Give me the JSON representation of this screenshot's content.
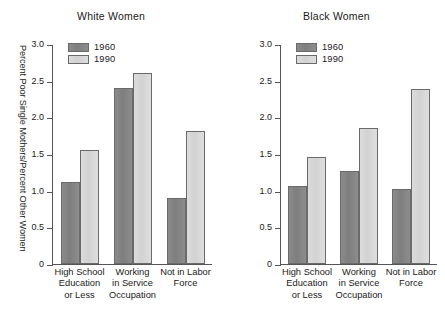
{
  "chart_data": [
    {
      "type": "bar",
      "title": "White Women",
      "xlabel": "",
      "ylabel": "Percent Poor Single Mothers/Percent Other Women",
      "ylim": [
        0,
        3.0
      ],
      "yticks": [
        "0",
        "0.5",
        "1.0",
        "1.5",
        "2.0",
        "2.5",
        "3.0"
      ],
      "ytick_values": [
        0,
        0.5,
        1.0,
        1.5,
        2.0,
        2.5,
        3.0
      ],
      "grid": false,
      "legend_position": "upper-left-inside",
      "categories": [
        [
          "High School",
          "Education",
          "or Less"
        ],
        [
          "Working",
          "in Service",
          "Occupation"
        ],
        [
          "Not in Labor",
          "Force"
        ]
      ],
      "series": [
        {
          "name": "1960",
          "color": "#828282",
          "values": [
            1.12,
            2.4,
            0.9
          ]
        },
        {
          "name": "1990",
          "color": "#d7d7d7",
          "values": [
            1.56,
            2.61,
            1.81
          ]
        }
      ]
    },
    {
      "type": "bar",
      "title": "Black Women",
      "xlabel": "",
      "ylabel": "Percent Poor Single Mothers/Percent Other Women",
      "ylim": [
        0,
        3.0
      ],
      "yticks": [
        "0",
        "0.5",
        "1.0",
        "1.5",
        "2.0",
        "2.5",
        "3.0"
      ],
      "ytick_values": [
        0,
        0.5,
        1.0,
        1.5,
        2.0,
        2.5,
        3.0
      ],
      "grid": false,
      "legend_position": "upper-left-inside",
      "categories": [
        [
          "High School",
          "Education",
          "or Less"
        ],
        [
          "Working",
          "in Service",
          "Occupation"
        ],
        [
          "Not in Labor",
          "Force"
        ]
      ],
      "series": [
        {
          "name": "1960",
          "color": "#828282",
          "values": [
            1.07,
            1.27,
            1.02
          ]
        },
        {
          "name": "1990",
          "color": "#d7d7d7",
          "values": [
            1.46,
            1.85,
            2.38
          ]
        }
      ]
    }
  ]
}
